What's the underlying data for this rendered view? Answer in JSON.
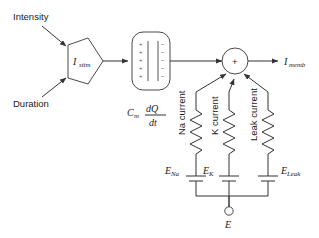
{
  "diagram": {
    "type": "circuit-block-diagram",
    "background_color": "#ffffff",
    "line_color": "#333333",
    "text_color": "#1a1a1a"
  },
  "inputs": {
    "intensity_label": "Intensity",
    "duration_label": "Duration"
  },
  "stimulus_block": {
    "shape": "pentagon",
    "label_main": "I",
    "label_sub": "stim"
  },
  "capacitor_block": {
    "shape": "rounded-rectangle",
    "positive_signs": [
      "+",
      "+",
      "+",
      "+",
      "+"
    ],
    "negative_signs": [
      "−",
      "−",
      "−",
      "−",
      "−"
    ],
    "formula": {
      "coefficient_main": "C",
      "coefficient_sub": "m",
      "numerator": "dQ",
      "denominator": "dt"
    }
  },
  "summing_junction": {
    "shape": "circle",
    "operator": "+"
  },
  "output": {
    "label_main": "I",
    "label_sub": "memb"
  },
  "branches": [
    {
      "name": "sodium",
      "current_label": "Na current",
      "resistor": "zigzag",
      "battery_main": "E",
      "battery_sub": "Na"
    },
    {
      "name": "potassium",
      "current_label": "K current",
      "resistor": "zigzag",
      "battery_main": "E",
      "battery_sub": "K"
    },
    {
      "name": "leak",
      "current_label": "Leak current",
      "resistor": "zigzag",
      "battery_main": "E",
      "battery_sub": "Leak"
    }
  ],
  "ground_terminal": {
    "shape": "circle-open",
    "label": "E"
  }
}
